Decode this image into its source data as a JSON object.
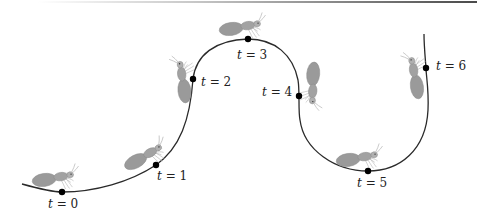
{
  "figure": {
    "colors": {
      "curve": "#2a2a2a",
      "ant_body": "#9a9a9a",
      "ant_outline": "#808080",
      "legs": "#b0b0b0",
      "point": "#000000",
      "text": "#222222",
      "top_rule": "#5a5a5a"
    },
    "time_points": [
      {
        "label": "t = 0",
        "var": "t",
        "value": "0",
        "x": 62,
        "y": 192,
        "lx": 48,
        "ly": 208,
        "ant": {
          "x": 58,
          "y": 178,
          "angle": -8
        }
      },
      {
        "label": "t = 1",
        "var": "t",
        "value": "1",
        "x": 156,
        "y": 165,
        "lx": 157,
        "ly": 180,
        "ant": {
          "x": 148,
          "y": 155,
          "angle": -28
        }
      },
      {
        "label": "t = 2",
        "var": "t",
        "value": "2",
        "x": 193,
        "y": 79,
        "lx": 201,
        "ly": 86,
        "ant": {
          "x": 183,
          "y": 77,
          "angle": -96
        }
      },
      {
        "label": "t = 3",
        "var": "t",
        "value": "3",
        "x": 248,
        "y": 39,
        "lx": 237,
        "ly": 59,
        "ant": {
          "x": 245,
          "y": 27,
          "angle": -8
        }
      },
      {
        "label": "t = 4",
        "var": "t",
        "value": "4",
        "x": 299,
        "y": 96,
        "lx": 262,
        "ly": 96,
        "ant": {
          "x": 312,
          "y": 88,
          "angle": 95
        }
      },
      {
        "label": "t = 5",
        "var": "t",
        "value": "5",
        "x": 368,
        "y": 171,
        "lx": 357,
        "ly": 187,
        "ant": {
          "x": 362,
          "y": 158,
          "angle": -8
        }
      },
      {
        "label": "t = 6",
        "var": "t",
        "value": "6",
        "x": 426,
        "y": 68,
        "lx": 436,
        "ly": 70,
        "ant": {
          "x": 415,
          "y": 73,
          "angle": -98
        }
      }
    ]
  }
}
